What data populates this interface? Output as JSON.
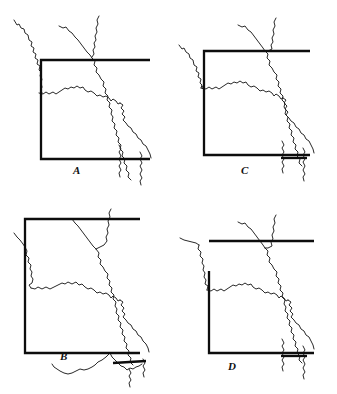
{
  "figure": {
    "title": "",
    "background_color": "#ffffff",
    "outline_color": "#171717",
    "box_color": "#0d0d0d",
    "panel_count": 4
  },
  "panels": [
    {
      "id": "a",
      "label": "A",
      "position": "top-left",
      "box": {
        "left_x": 41,
        "top_y": 60,
        "right_x": 150,
        "bottom_y": 159,
        "edges_drawn": [
          "top",
          "left",
          "bottom"
        ]
      }
    },
    {
      "id": "c",
      "label": "C",
      "position": "top-right",
      "box": {
        "left_x": 36,
        "top_y": 51,
        "right_x": 142,
        "bottom_y": 155,
        "edges_drawn": [
          "top",
          "left",
          "bottom"
        ]
      }
    },
    {
      "id": "b",
      "label": "B",
      "position": "bottom-left",
      "box": {
        "left_x": 25,
        "top_y": 22,
        "right_x": 140,
        "bottom_y": 156,
        "edges_drawn": [
          "top",
          "left",
          "bottom"
        ]
      }
    },
    {
      "id": "d",
      "label": "D",
      "position": "bottom-right",
      "box": {
        "left_x": 41,
        "top_y": 44,
        "right_x": 146,
        "bottom_y": 156,
        "edges_drawn": [
          "top",
          "left",
          "bottom"
        ]
      }
    }
  ],
  "labels": {
    "a": "A",
    "b": "B",
    "c": "C",
    "d": "D"
  }
}
